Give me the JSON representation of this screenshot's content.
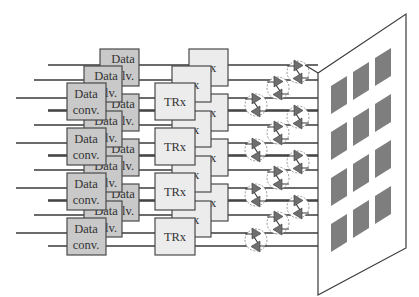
{
  "diagram": {
    "title": "",
    "layers": 3,
    "rows_per_layer": 4,
    "blocks": {
      "data_converter": {
        "label_line1": "Data",
        "label_line2": "conv.",
        "partial_label_line2": "lv.",
        "fill_color": "#c9c9c9"
      },
      "transceiver": {
        "label": "TRx",
        "partial_label": "x",
        "fill_color": "#ececec"
      }
    },
    "phase_shifter": {
      "count": 12,
      "amplifier_fill": "#6f6f6f",
      "circle_style": "dashed"
    },
    "antenna_panel": {
      "patch_rows": 4,
      "patch_cols": 3,
      "patch_color": "#7e7e7e"
    },
    "labels": {
      "data": "Data",
      "conv": "conv.",
      "lv": "lv.",
      "trx": "TRx",
      "x": "x"
    }
  }
}
